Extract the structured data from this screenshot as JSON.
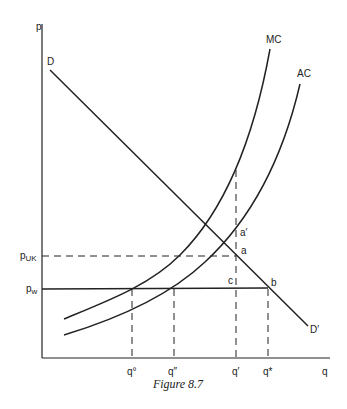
{
  "figure": {
    "caption": "Figure 8.7",
    "axes": {
      "y_label": "p",
      "x_label": "q"
    },
    "curves": {
      "demand_start_label": "D",
      "demand_end_label": "D′",
      "mc_label": "MC",
      "ac_label": "AC"
    },
    "price_levels": {
      "p_uk": "p",
      "p_uk_sub": "UK",
      "p_w": "p",
      "p_w_sub": "w"
    },
    "points": {
      "a": "a",
      "a_prime": "a′",
      "b": "b",
      "c": "c"
    },
    "quantities": {
      "q0": "q°",
      "q_double_prime": "q″",
      "q_prime": "q′",
      "q_star": "q*"
    }
  }
}
